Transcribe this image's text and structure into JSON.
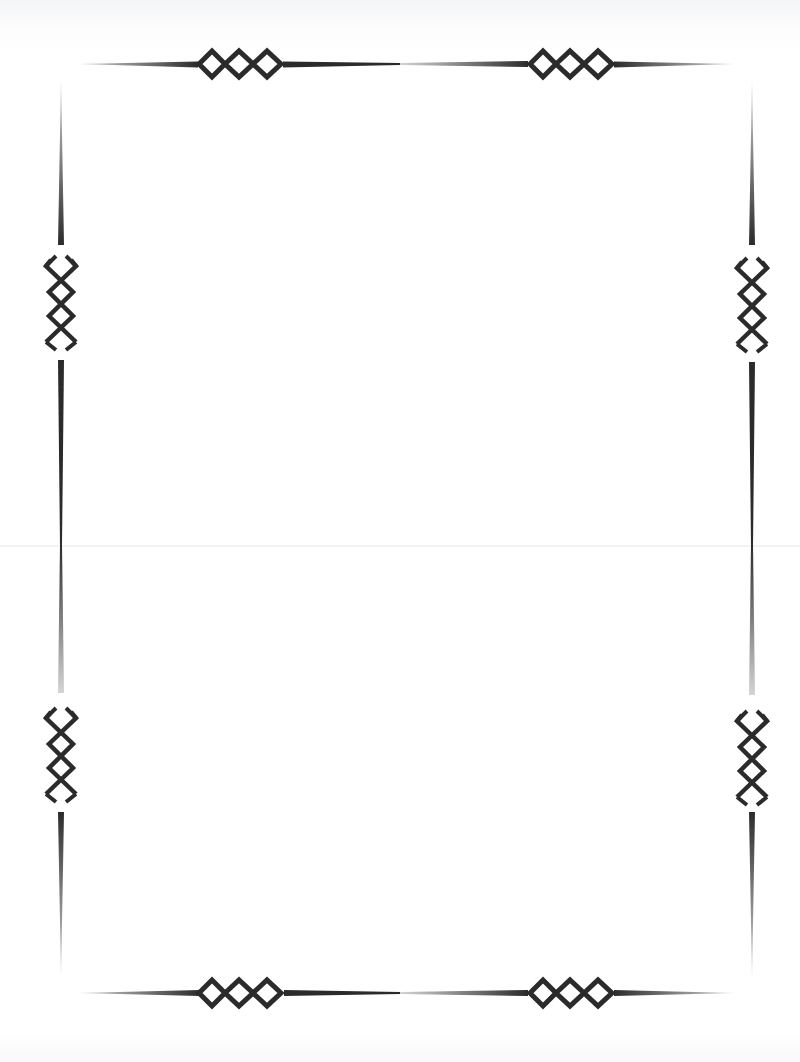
{
  "document": {
    "type": "blank decorative border page",
    "content_text": ""
  },
  "frame": {
    "stroke_color": "#2b2b2b",
    "background_color": "#ffffff",
    "ornament": "triple-diamond chain",
    "ornaments": [
      {
        "position": "top-left",
        "orientation": "horizontal"
      },
      {
        "position": "top-right",
        "orientation": "horizontal"
      },
      {
        "position": "bottom-left",
        "orientation": "horizontal"
      },
      {
        "position": "bottom-right",
        "orientation": "horizontal"
      },
      {
        "position": "left-upper",
        "orientation": "vertical"
      },
      {
        "position": "left-lower",
        "orientation": "vertical"
      },
      {
        "position": "right-upper",
        "orientation": "vertical"
      },
      {
        "position": "right-lower",
        "orientation": "vertical"
      }
    ]
  }
}
